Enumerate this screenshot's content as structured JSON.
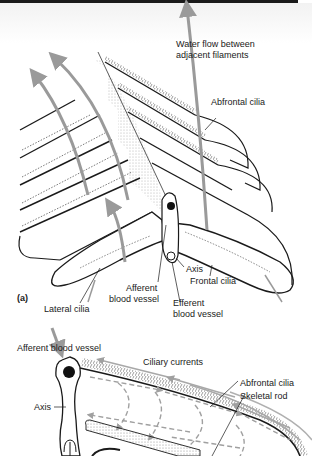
{
  "panel_a": {
    "tag": "(a)",
    "labels": {
      "water_flow_line1": "Water flow between",
      "water_flow_line2": "adjacent filaments",
      "abfrontal_cilia": "Abfrontal cilia",
      "axis": "Axis",
      "frontal_cilia": "Frontal cilia",
      "afferent_line1": "Afferent",
      "afferent_line2": "blood vessel",
      "efferent_line1": "Efferent",
      "efferent_line2": "blood vessel",
      "lateral_cilia": "Lateral cilia"
    }
  },
  "panel_b": {
    "labels": {
      "afferent_blood_vessel": "Afferent blood vessel",
      "ciliary_currents": "Ciliary currents",
      "abfrontal_cilia": "Abfrontal cilia",
      "skeletal_rod": "Skeletal rod",
      "axis": "Axis"
    }
  },
  "colors": {
    "ink": "#1a1a1a",
    "arrow_gray": "#9a9a9a",
    "stipple": "#b0b0b0",
    "background": "#ffffff"
  }
}
